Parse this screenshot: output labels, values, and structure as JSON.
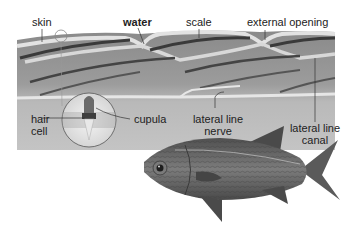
{
  "diagram": {
    "labels": {
      "skin": "skin",
      "water": "water",
      "scale": "scale",
      "external_opening": "external opening",
      "hair_cell_line1": "hair",
      "hair_cell_line2": "cell",
      "cupula": "cupula",
      "lateral_line_nerve_line1": "lateral line",
      "lateral_line_nerve_line2": "nerve",
      "lateral_line_canal_line1": "lateral line",
      "lateral_line_canal_line2": "canal"
    },
    "colors": {
      "tissue": "#9a9a9a",
      "tissue_light": "#c8c8c8",
      "skin_layer": "#e0e0e0",
      "dark_streak": "#3a3a3a",
      "fish_body": "#6e6e6e",
      "fish_dark": "#3c3c3c",
      "label_text": "#222222",
      "leader_line": "#333333"
    }
  }
}
